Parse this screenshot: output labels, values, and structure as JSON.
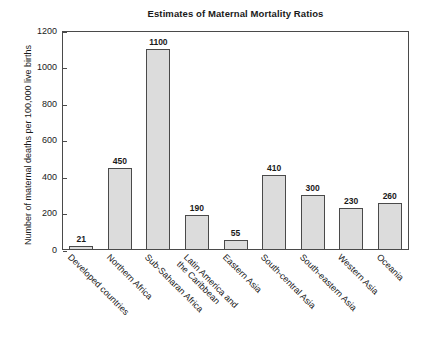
{
  "chart_data": {
    "type": "bar",
    "title": "Estimates of Maternal Mortality Ratios",
    "xlabel": "",
    "ylabel": "Number of maternal deaths per 100,000 live births",
    "ylim": [
      0,
      1200
    ],
    "ytick_step": 200,
    "ytick_labels": [
      "0",
      "200",
      "400",
      "600",
      "800",
      "1000",
      "1200"
    ],
    "grid": false,
    "legend": "none",
    "bar_fill_color": "#dcdcdc",
    "bar_border_color": "#4a4a4a",
    "axis_color": "#4a4a4a",
    "text_color": "#1a1a1a",
    "background_color": "#ffffff",
    "categories": [
      "Developed countries",
      "Northern Africa",
      "Sub-Saharan Africa",
      "Latin America and the Caribbean",
      "Eastern Asia",
      "South-central Asia",
      "South-eastern Asia",
      "Western Asia",
      "Oceania"
    ],
    "values": [
      21,
      450,
      1100,
      190,
      55,
      410,
      300,
      230,
      260
    ],
    "value_labels": [
      "21",
      "450",
      "1100",
      "190",
      "55",
      "410",
      "300",
      "230",
      "260"
    ],
    "category_label_lines": [
      [
        "Developed countries"
      ],
      [
        "Northern Africa"
      ],
      [
        "Sub-Saharan Africa"
      ],
      [
        "Latin America and",
        "the Caribbean"
      ],
      [
        "Eastern Asia"
      ],
      [
        "South-central Asia"
      ],
      [
        "South-eastern Asia"
      ],
      [
        "Western Asia"
      ],
      [
        "Oceania"
      ]
    ]
  }
}
